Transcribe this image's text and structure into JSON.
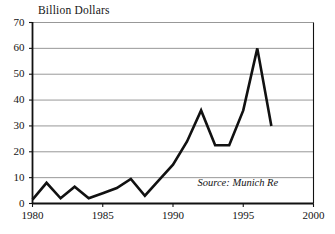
{
  "chart_data": {
    "type": "line",
    "title": "Billion Dollars",
    "xlabel": "",
    "ylabel": "Billion Dollars",
    "xlim": [
      1980,
      2000
    ],
    "ylim": [
      0,
      70
    ],
    "grid": true,
    "legend": "none",
    "annotations": [
      "Source: Munich Re"
    ],
    "x": [
      1980,
      1981,
      1982,
      1983,
      1984,
      1985,
      1986,
      1987,
      1988,
      1989,
      1990,
      1991,
      1992,
      1993,
      1994,
      1995,
      1996,
      1997
    ],
    "values": [
      1.5,
      8,
      2,
      6.5,
      2,
      4,
      6,
      9.5,
      3,
      9,
      15,
      24,
      36,
      22.5,
      22.5,
      36,
      60,
      30
    ],
    "series": [
      {
        "name": "Insured catastrophe losses",
        "values": [
          1.5,
          8,
          2,
          6.5,
          2,
          4,
          6,
          9.5,
          3,
          9,
          15,
          24,
          36,
          22.5,
          22.5,
          36,
          60,
          30
        ]
      }
    ],
    "ytick_labels": [
      "0",
      "10",
      "20",
      "30",
      "40",
      "50",
      "60",
      "70"
    ],
    "ytick_values": [
      0,
      10,
      20,
      30,
      40,
      50,
      60,
      70
    ],
    "xtick_labels": [
      "1980",
      "1985",
      "1990",
      "1995",
      "2000"
    ],
    "xtick_values": [
      1980,
      1985,
      1990,
      1995,
      2000
    ],
    "colors": {
      "line": "#111111",
      "grid": "#8c8c8c",
      "axis": "#111111",
      "background": "#ffffff",
      "text": "#141414"
    }
  },
  "source_note": "Source: Munich Re"
}
